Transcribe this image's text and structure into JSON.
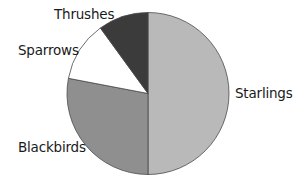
{
  "chart_data": {
    "type": "pie",
    "title": "",
    "start_angle_deg": 0,
    "direction": "clockwise",
    "categories": [
      "Starlings",
      "Blackbirds",
      "Sparrows",
      "Thrushes"
    ],
    "values": [
      50,
      28,
      12,
      10
    ],
    "colors": [
      "#b9b9b9",
      "#8f8f8f",
      "#ffffff",
      "#3b3b3b"
    ],
    "legend": "none",
    "labels_position": "outside"
  },
  "labels": {
    "starlings": "Starlings",
    "blackbirds": "Blackbirds",
    "sparrows": "Sparrows",
    "thrushes": "Thrushes"
  }
}
